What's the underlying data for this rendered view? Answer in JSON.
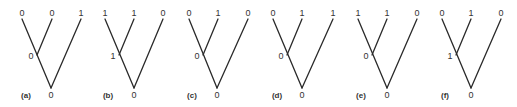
{
  "figure": {
    "trees": [
      {
        "caption": "(a)",
        "leaves": [
          "0",
          "0",
          "1"
        ],
        "internal": "0",
        "root": "0"
      },
      {
        "caption": "(b)",
        "leaves": [
          "1",
          "1",
          "0"
        ],
        "internal": "1",
        "root": "0"
      },
      {
        "caption": "(c)",
        "leaves": [
          "0",
          "1",
          "0"
        ],
        "internal": "0",
        "root": "0"
      },
      {
        "caption": "(d)",
        "leaves": [
          "0",
          "1",
          "1"
        ],
        "internal": "0",
        "root": "0"
      },
      {
        "caption": "(e)",
        "leaves": [
          "1",
          "1",
          "0"
        ],
        "internal": "0",
        "root": "0"
      },
      {
        "caption": "(f)",
        "leaves": [
          "0",
          "1",
          "0"
        ],
        "internal": "1",
        "root": "0"
      }
    ]
  }
}
